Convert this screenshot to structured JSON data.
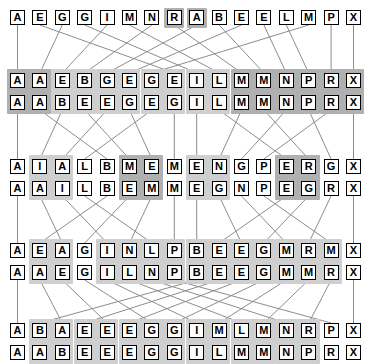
{
  "layout": {
    "width": 383,
    "height": 362,
    "col_count": 16,
    "col_x0": 10,
    "col_step": 22.4,
    "cell_w": 15,
    "cell_h": 15,
    "row_y": [
      10,
      73,
      95,
      159,
      181,
      243,
      265,
      323,
      345
    ],
    "colors": {
      "background": "#ffffff",
      "cell_fill": "#ffffff",
      "cell_border": "#000000",
      "text": "#000000",
      "wire": "#8d8d8d",
      "group_light": "#cfcfcf",
      "group_dark": "#b0b0b0"
    }
  },
  "stages": [
    {
      "name": "input",
      "kind": "single",
      "rows": [
        {
          "name": "input-row",
          "letters": [
            "A",
            "E",
            "G",
            "G",
            "I",
            "M",
            "N",
            "R",
            "A",
            "B",
            "E",
            "E",
            "L",
            "M",
            "P",
            "X"
          ],
          "shaded": [
            false,
            false,
            false,
            false,
            false,
            false,
            false,
            true,
            true,
            false,
            false,
            false,
            false,
            false,
            false,
            false
          ]
        }
      ],
      "groups": []
    },
    {
      "name": "pass-1",
      "kind": "pair",
      "rows": [
        {
          "name": "pass-1-before",
          "letters": [
            "A",
            "A",
            "E",
            "B",
            "G",
            "E",
            "G",
            "E",
            "I",
            "L",
            "M",
            "M",
            "N",
            "P",
            "R",
            "X"
          ]
        },
        {
          "name": "pass-1-after",
          "letters": [
            "A",
            "A",
            "B",
            "E",
            "E",
            "G",
            "E",
            "G",
            "I",
            "L",
            "M",
            "M",
            "N",
            "P",
            "R",
            "X"
          ]
        }
      ],
      "groups": [
        {
          "start": 0,
          "span": 2,
          "tone": "dark"
        },
        {
          "start": 2,
          "span": 2,
          "tone": "light"
        },
        {
          "start": 4,
          "span": 2,
          "tone": "light"
        },
        {
          "start": 6,
          "span": 2,
          "tone": "light"
        },
        {
          "start": 8,
          "span": 2,
          "tone": "light"
        },
        {
          "start": 10,
          "span": 2,
          "tone": "dark"
        },
        {
          "start": 12,
          "span": 2,
          "tone": "dark"
        },
        {
          "start": 14,
          "span": 2,
          "tone": "dark"
        }
      ]
    },
    {
      "name": "pass-2",
      "kind": "pair",
      "rows": [
        {
          "name": "pass-2-before",
          "letters": [
            "A",
            "I",
            "A",
            "L",
            "B",
            "M",
            "E",
            "M",
            "E",
            "N",
            "G",
            "P",
            "E",
            "R",
            "G",
            "X"
          ]
        },
        {
          "name": "pass-2-after",
          "letters": [
            "A",
            "A",
            "I",
            "L",
            "B",
            "E",
            "M",
            "M",
            "E",
            "G",
            "N",
            "P",
            "E",
            "G",
            "R",
            "X"
          ]
        }
      ],
      "groups": [
        {
          "start": 1,
          "span": 2,
          "tone": "light"
        },
        {
          "start": 5,
          "span": 2,
          "tone": "dark"
        },
        {
          "start": 8,
          "span": 2,
          "tone": "light"
        },
        {
          "start": 12,
          "span": 2,
          "tone": "dark"
        }
      ]
    },
    {
      "name": "pass-3",
      "kind": "pair",
      "rows": [
        {
          "name": "pass-3-before",
          "letters": [
            "A",
            "E",
            "A",
            "G",
            "I",
            "N",
            "L",
            "P",
            "B",
            "E",
            "E",
            "G",
            "M",
            "R",
            "M",
            "X"
          ]
        },
        {
          "name": "pass-3-after",
          "letters": [
            "A",
            "A",
            "E",
            "G",
            "I",
            "L",
            "N",
            "P",
            "B",
            "E",
            "E",
            "G",
            "M",
            "M",
            "R",
            "X"
          ]
        }
      ],
      "groups": [
        {
          "start": 1,
          "span": 2,
          "tone": "light"
        },
        {
          "start": 4,
          "span": 4,
          "tone": "light"
        },
        {
          "start": 8,
          "span": 4,
          "tone": "light"
        },
        {
          "start": 12,
          "span": 3,
          "tone": "light"
        }
      ]
    },
    {
      "name": "pass-4",
      "kind": "pair",
      "rows": [
        {
          "name": "pass-4-before",
          "letters": [
            "A",
            "B",
            "A",
            "E",
            "E",
            "E",
            "G",
            "G",
            "I",
            "M",
            "L",
            "M",
            "N",
            "R",
            "P",
            "X"
          ]
        },
        {
          "name": "pass-4-after",
          "letters": [
            "A",
            "A",
            "B",
            "E",
            "E",
            "E",
            "G",
            "G",
            "I",
            "L",
            "M",
            "M",
            "N",
            "P",
            "R",
            "X"
          ]
        }
      ],
      "groups": [
        {
          "start": 1,
          "span": 2,
          "tone": "light"
        },
        {
          "start": 3,
          "span": 2,
          "tone": "light"
        },
        {
          "start": 5,
          "span": 3,
          "tone": "light"
        },
        {
          "start": 8,
          "span": 2,
          "tone": "light"
        },
        {
          "start": 10,
          "span": 2,
          "tone": "light"
        },
        {
          "start": 12,
          "span": 2,
          "tone": "light"
        }
      ]
    }
  ],
  "wires": [
    {
      "from_stage": 0,
      "to_stage": 1,
      "map": [
        0,
        2,
        4,
        6,
        8,
        10,
        13,
        1,
        3,
        5,
        7,
        9,
        11,
        12,
        14,
        15
      ]
    },
    {
      "from_stage": 1,
      "to_stage": 2,
      "map": [
        0,
        2,
        4,
        6,
        1,
        3,
        5,
        7,
        8,
        10,
        12,
        14,
        9,
        11,
        13,
        15
      ]
    },
    {
      "from_stage": 2,
      "to_stage": 3,
      "map": [
        0,
        4,
        1,
        5,
        2,
        6,
        3,
        7,
        8,
        12,
        9,
        13,
        10,
        14,
        11,
        15
      ]
    },
    {
      "from_stage": 3,
      "to_stage": 4,
      "map": [
        0,
        8,
        1,
        9,
        2,
        10,
        3,
        11,
        4,
        12,
        5,
        13,
        6,
        14,
        7,
        15
      ]
    }
  ]
}
